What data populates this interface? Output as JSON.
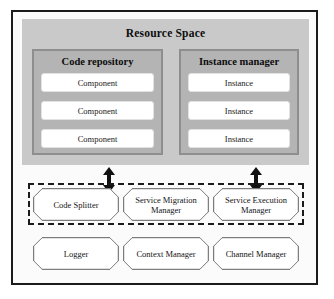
{
  "figure": {
    "resource_space": {
      "title": "Resource Space",
      "panels": [
        {
          "name": "code-repository",
          "title": "Code repository",
          "items": [
            "Component",
            "Component",
            "Component"
          ]
        },
        {
          "name": "instance-manager",
          "title": "Instance manager",
          "items": [
            "Instance",
            "Instance",
            "Instance"
          ]
        }
      ]
    },
    "connectors": [
      {
        "name": "left-double-arrow",
        "direction": "bidirectional"
      },
      {
        "name": "right-double-arrow",
        "direction": "bidirectional"
      }
    ],
    "service_layer": {
      "grouped_nodes": [
        "Code Splitter",
        "Service Migration Manager",
        "Service Execution Manager"
      ],
      "support_nodes": [
        "Logger",
        "Context Manager",
        "Channel Manager"
      ]
    },
    "colors": {
      "frame": "#1b1b1b",
      "resource_space_bg": "#c9c9c9",
      "sub_panel_bg": "#b4b4b4",
      "sub_panel_border": "#8e8e8e",
      "item_bg": "#ffffff",
      "canvas_bg": "#fbfbfb",
      "node_border": "#5f5f5f"
    }
  }
}
